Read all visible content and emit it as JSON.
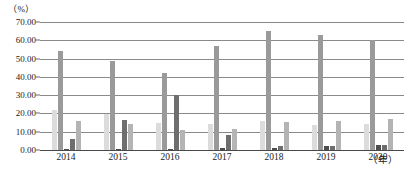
{
  "chart_data": {
    "type": "bar",
    "title": "",
    "subtitle": "",
    "xlabel": "年",
    "ylabel": "%",
    "y_unit_label": "（%）",
    "x_unit_label": "（年）",
    "categories": [
      "2014",
      "2015",
      "2016",
      "2017",
      "2018",
      "2019",
      "2020"
    ],
    "ylim": [
      0,
      70
    ],
    "yticks": [
      "0.00",
      "10.00",
      "20.00",
      "30.00",
      "40.00",
      "50.00",
      "60.00",
      "70.00"
    ],
    "ytick_values": [
      0,
      10,
      20,
      30,
      40,
      50,
      60,
      70
    ],
    "grid": true,
    "legend": "none",
    "series": [
      {
        "name": "series-1",
        "color": "#dcdcdc",
        "values": [
          22.0,
          19.5,
          15.0,
          14.5,
          16.0,
          13.5,
          14.0
        ]
      },
      {
        "name": "series-2",
        "color": "#9a9a9a",
        "values": [
          54.0,
          48.5,
          42.0,
          57.0,
          65.0,
          63.0,
          60.0
        ]
      },
      {
        "name": "series-3",
        "color": "#4d4d4d",
        "values": [
          0.6,
          0.6,
          0.6,
          1.0,
          1.2,
          2.0,
          2.5
        ]
      },
      {
        "name": "series-4",
        "color": "#6e6e6e",
        "values": [
          6.0,
          16.5,
          30.0,
          8.0,
          2.0,
          2.0,
          2.5
        ]
      },
      {
        "name": "series-5",
        "color": "#b4b4b4",
        "values": [
          16.0,
          14.0,
          11.0,
          11.5,
          15.5,
          16.0,
          17.0
        ]
      }
    ]
  }
}
